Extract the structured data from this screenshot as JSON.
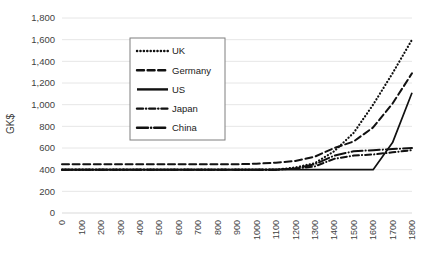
{
  "chart_data": {
    "type": "line",
    "title": "",
    "xlabel": "",
    "ylabel": "GK$",
    "xlim": [
      0,
      1800
    ],
    "ylim": [
      0,
      1800
    ],
    "grid": true,
    "legend_position": "upper-left-inside",
    "x": [
      0,
      100,
      200,
      300,
      400,
      500,
      600,
      700,
      800,
      900,
      1000,
      1100,
      1200,
      1300,
      1400,
      1500,
      1600,
      1700,
      1800
    ],
    "xticks": [
      "0",
      "100",
      "200",
      "300",
      "400",
      "500",
      "600",
      "700",
      "800",
      "900",
      "1000",
      "1100",
      "1200",
      "1300",
      "1400",
      "1500",
      "1600",
      "1700",
      "1800"
    ],
    "yticks": [
      "0",
      "200",
      "400",
      "600",
      "800",
      "1,000",
      "1,200",
      "1,400",
      "1,600",
      "1,800"
    ],
    "ytick_values": [
      0,
      200,
      400,
      600,
      800,
      1000,
      1200,
      1400,
      1600,
      1800
    ],
    "series": [
      {
        "name": "UK",
        "dash": "dotted",
        "values": [
          400,
          400,
          400,
          400,
          400,
          400,
          400,
          400,
          400,
          400,
          400,
          400,
          420,
          460,
          570,
          740,
          1000,
          1290,
          1600
        ]
      },
      {
        "name": "Germany",
        "dash": "dashed",
        "values": [
          450,
          450,
          450,
          450,
          450,
          450,
          450,
          450,
          450,
          450,
          455,
          465,
          480,
          520,
          600,
          660,
          790,
          1010,
          1290
        ]
      },
      {
        "name": "US",
        "dash": "solid",
        "values": [
          400,
          400,
          400,
          400,
          400,
          400,
          400,
          400,
          400,
          400,
          400,
          400,
          400,
          400,
          400,
          400,
          400,
          650,
          1110
        ]
      },
      {
        "name": "Japan",
        "dash": "dash-dot",
        "values": [
          400,
          400,
          400,
          400,
          400,
          400,
          400,
          400,
          400,
          400,
          400,
          400,
          410,
          430,
          500,
          530,
          540,
          560,
          580
        ]
      },
      {
        "name": "China",
        "dash": "long-dash-dot",
        "values": [
          400,
          400,
          400,
          400,
          400,
          400,
          400,
          400,
          400,
          400,
          400,
          400,
          410,
          450,
          530,
          570,
          580,
          590,
          600
        ]
      }
    ]
  },
  "legend": {
    "items": [
      {
        "label": "UK"
      },
      {
        "label": "Germany"
      },
      {
        "label": "US"
      },
      {
        "label": "Japan"
      },
      {
        "label": "China"
      }
    ]
  },
  "colors": {
    "series": "#111111",
    "grid": "#e6e6e6",
    "text": "#3f3f3f",
    "background": "#ffffff"
  }
}
